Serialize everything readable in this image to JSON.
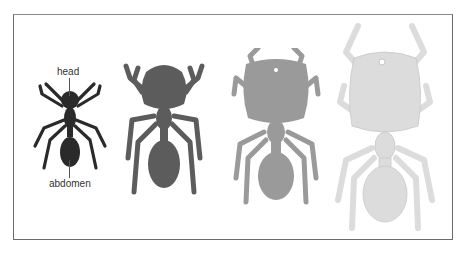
{
  "figure": {
    "labels": {
      "head": "head",
      "abdomen": "abdomen"
    },
    "ants": [
      {
        "name": "ant-1",
        "color": "#2a2a2a",
        "note": "small head, darkest"
      },
      {
        "name": "ant-2",
        "color": "#5c5c5c",
        "note": "larger head"
      },
      {
        "name": "ant-3",
        "color": "#9a9a9a",
        "note": "large head"
      },
      {
        "name": "ant-4",
        "color": "#dcdcdc",
        "note": "largest head, lightest"
      }
    ],
    "frame_color": "#6a6a6a"
  }
}
